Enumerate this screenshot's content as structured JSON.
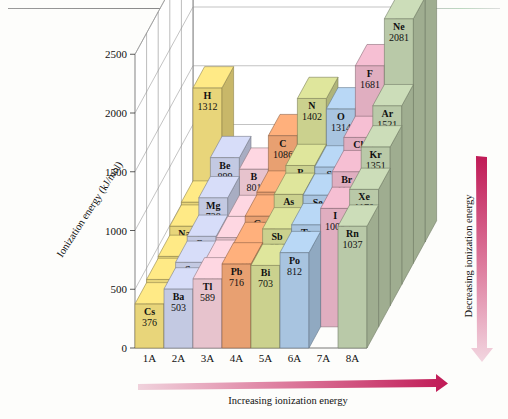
{
  "figure": {
    "title": "Trends in First Ionization Energy",
    "y_axis_label": "Ionization energy (kJ/mol)",
    "y_ticks": [
      "0",
      "500",
      "1000",
      "1500",
      "2000",
      "2500"
    ],
    "group_labels": [
      "1A",
      "2A",
      "3A",
      "4A",
      "5A",
      "6A",
      "7A",
      "8A"
    ],
    "arrow_bottom_label": "Increasing ionization energy",
    "arrow_right_label": "Decreasing ionization energy",
    "arrow_color": "#c8396b"
  },
  "chart_data": {
    "type": "bar",
    "title": "Trends in First Ionization Energy",
    "xlabel": "",
    "ylabel": "Ionization energy (kJ/mol)",
    "ylim": [
      0,
      2500
    ],
    "grid": true,
    "legend": "none",
    "categories": [
      "1A",
      "2A",
      "3A",
      "4A",
      "5A",
      "6A",
      "7A",
      "8A"
    ],
    "periods": [
      "1",
      "2",
      "3",
      "4",
      "5",
      "6"
    ],
    "series": [
      {
        "name": "1A",
        "color": "#e8d57a",
        "points": [
          {
            "symbol": "H",
            "value": 1312,
            "period": 1
          },
          {
            "symbol": "Li",
            "value": 520,
            "period": 2
          },
          {
            "symbol": "Na",
            "value": 496,
            "period": 3
          },
          {
            "symbol": "K",
            "value": 419,
            "period": 4
          },
          {
            "symbol": "Rb",
            "value": 403,
            "period": 5
          },
          {
            "symbol": "Cs",
            "value": 376,
            "period": 6
          }
        ]
      },
      {
        "name": "2A",
        "color": "#c3c9e2",
        "points": [
          {
            "symbol": "Be",
            "value": 899,
            "period": 2
          },
          {
            "symbol": "Mg",
            "value": 738,
            "period": 3
          },
          {
            "symbol": "Ca",
            "value": 590,
            "period": 4
          },
          {
            "symbol": "Sr",
            "value": 549,
            "period": 5
          },
          {
            "symbol": "Ba",
            "value": 503,
            "period": 6
          }
        ]
      },
      {
        "name": "3A",
        "color": "#e7c3cd",
        "points": [
          {
            "symbol": "B",
            "value": 801,
            "period": 2
          },
          {
            "symbol": "Al",
            "value": 578,
            "period": 3
          },
          {
            "symbol": "Ga",
            "value": 579,
            "period": 4
          },
          {
            "symbol": "In",
            "value": 558,
            "period": 5
          },
          {
            "symbol": "Tl",
            "value": 589,
            "period": 6
          }
        ]
      },
      {
        "name": "4A",
        "color": "#e8a071",
        "points": [
          {
            "symbol": "C",
            "value": 1086,
            "period": 2
          },
          {
            "symbol": "Si",
            "value": 786,
            "period": 3
          },
          {
            "symbol": "Ge",
            "value": 762,
            "period": 4
          },
          {
            "symbol": "Sn",
            "value": 709,
            "period": 5
          },
          {
            "symbol": "Pb",
            "value": 716,
            "period": 6
          }
        ]
      },
      {
        "name": "5A",
        "color": "#cbd18e",
        "points": [
          {
            "symbol": "N",
            "value": 1402,
            "period": 2
          },
          {
            "symbol": "P",
            "value": 1012,
            "period": 3
          },
          {
            "symbol": "As",
            "value": 947,
            "period": 4
          },
          {
            "symbol": "Sb",
            "value": 834,
            "period": 5
          },
          {
            "symbol": "Bi",
            "value": 703,
            "period": 6
          }
        ]
      },
      {
        "name": "6A",
        "color": "#a8c4e0",
        "points": [
          {
            "symbol": "O",
            "value": 1314,
            "period": 2
          },
          {
            "symbol": "S",
            "value": 1000,
            "period": 3
          },
          {
            "symbol": "Se",
            "value": 941,
            "period": 4
          },
          {
            "symbol": "Te",
            "value": 869,
            "period": 5
          },
          {
            "symbol": "Po",
            "value": 812,
            "period": 6
          }
        ]
      },
      {
        "name": "7A",
        "color": "#e0aec0",
        "points": [
          {
            "symbol": "F",
            "value": 1681,
            "period": 2
          },
          {
            "symbol": "Cl",
            "value": 1251,
            "period": 3
          },
          {
            "symbol": "Br",
            "value": 1140,
            "period": 4
          },
          {
            "symbol": "I",
            "value": 1008,
            "period": 5
          }
        ]
      },
      {
        "name": "8A",
        "color": "#b9c9a8",
        "points": [
          {
            "symbol": "He",
            "value": 2372,
            "period": 1
          },
          {
            "symbol": "Ne",
            "value": 2081,
            "period": 2
          },
          {
            "symbol": "Ar",
            "value": 1521,
            "period": 3
          },
          {
            "symbol": "Kr",
            "value": 1351,
            "period": 4
          },
          {
            "symbol": "Xe",
            "value": 1170,
            "period": 5
          },
          {
            "symbol": "Rn",
            "value": 1037,
            "period": 6
          }
        ]
      }
    ]
  }
}
